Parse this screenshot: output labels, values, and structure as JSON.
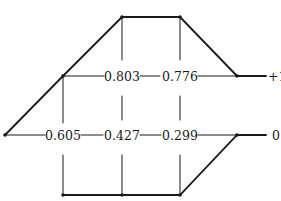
{
  "diagram": {
    "type": "trellis-path-diagram",
    "colors": {
      "line": "#1a1a1a",
      "background": "#ffffff"
    },
    "nodes": [
      {
        "id": "start",
        "x": 5,
        "y": 135
      },
      {
        "id": "u1",
        "x": 63,
        "y": 76
      },
      {
        "id": "t1",
        "x": 122,
        "y": 17
      },
      {
        "id": "t2",
        "x": 180,
        "y": 17
      },
      {
        "id": "ru",
        "x": 237,
        "y": 76
      },
      {
        "id": "rl",
        "x": 237,
        "y": 135
      },
      {
        "id": "b1",
        "x": 63,
        "y": 195
      },
      {
        "id": "b2",
        "x": 122,
        "y": 195
      },
      {
        "id": "b3",
        "x": 180,
        "y": 195
      }
    ],
    "upper_row": {
      "values": [
        "0.803",
        "0.776"
      ],
      "end_label": "+1"
    },
    "lower_row": {
      "values": [
        "0.605",
        "0.427",
        "0.299"
      ],
      "end_label": "0"
    }
  }
}
